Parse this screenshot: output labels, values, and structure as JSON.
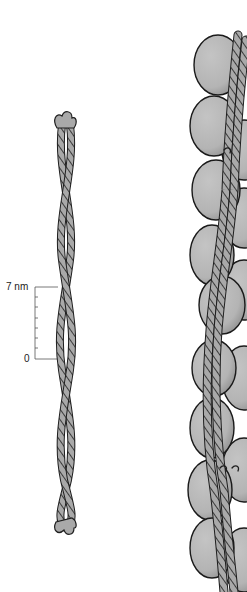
{
  "scale_bar": {
    "top_label": "7 nm",
    "bottom_label": "0",
    "minor_ticks": 6
  },
  "colors": {
    "strand_fill": "#a9a9a9",
    "strand_stroke": "#1e1e1e",
    "globule_fill": "#b8b8b8",
    "globule_shade": "#8f8f8f",
    "outline": "#1a1a1a"
  },
  "panels": [
    {
      "name": "coiled-coil-strand",
      "description": "two-stranded coiled coil"
    },
    {
      "name": "filament-with-globules",
      "description": "globular subunits with twisted strands"
    }
  ]
}
